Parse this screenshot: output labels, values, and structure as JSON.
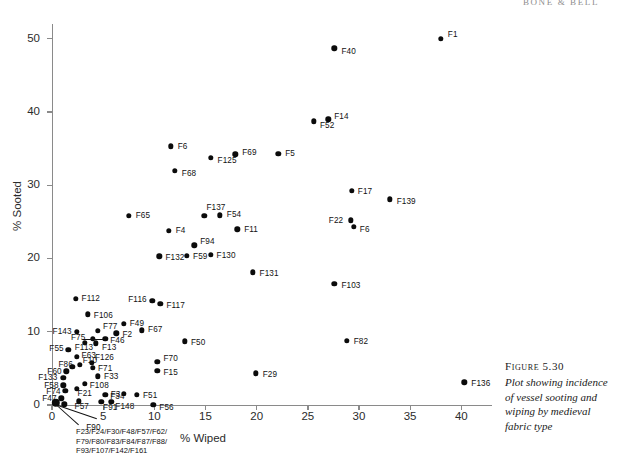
{
  "header": {
    "running_head": "BONE & BELL"
  },
  "caption": {
    "figure_number": "Figure 5.30",
    "text": "Plot showing incidence of vessel sooting and wiping by medieval fabric type"
  },
  "annotation": {
    "cluster_note_lines": [
      "F23/F24/F30/F48/F57/F62/",
      "F79/F80/F83/F84/F87/F88/",
      "F93/F107/F142/F161"
    ]
  },
  "chart_data": {
    "type": "scatter",
    "title": "Plot showing incidence of vessel sooting and wiping by medieval fabric type",
    "xlabel": "% Wiped",
    "ylabel": "% Sooted",
    "xlim": [
      0,
      43
    ],
    "ylim": [
      0,
      52
    ],
    "xticks": [
      0,
      5,
      10,
      15,
      20,
      25,
      30,
      35,
      40
    ],
    "yticks": [
      0,
      10,
      20,
      30,
      40,
      50
    ],
    "grid": false,
    "legend": null,
    "point_label_field": "fabric type",
    "points": [
      {
        "label": "F1",
        "x": 38.0,
        "y": 50.0,
        "lx": 7,
        "ly": -4
      },
      {
        "label": "F40",
        "x": 27.6,
        "y": 48.7,
        "lx": 7,
        "ly": 3
      },
      {
        "label": "F52",
        "x": 25.6,
        "y": 38.7,
        "lx": 6,
        "ly": 4
      },
      {
        "label": "F14",
        "x": 27.0,
        "y": 39.0,
        "lx": 6,
        "ly": -3
      },
      {
        "label": "F6",
        "x": 11.6,
        "y": 35.3,
        "lx": 7,
        "ly": 0
      },
      {
        "label": "F125",
        "x": 15.5,
        "y": 33.7,
        "lx": 7,
        "ly": 2
      },
      {
        "label": "F69",
        "x": 17.9,
        "y": 34.2,
        "lx": 7,
        "ly": -2
      },
      {
        "label": "F5",
        "x": 22.1,
        "y": 34.3,
        "lx": 7,
        "ly": 0
      },
      {
        "label": "F68",
        "x": 12.0,
        "y": 32.0,
        "lx": 7,
        "ly": 3
      },
      {
        "label": "F17",
        "x": 29.3,
        "y": 29.2,
        "lx": 6,
        "ly": 0
      },
      {
        "label": "F139",
        "x": 33.0,
        "y": 28.1,
        "lx": 7,
        "ly": 2
      },
      {
        "label": "F65",
        "x": 7.5,
        "y": 25.8,
        "lx": 7,
        "ly": 0
      },
      {
        "label": "F137",
        "x": 14.9,
        "y": 25.8,
        "lx": 2,
        "ly": -8
      },
      {
        "label": "F54",
        "x": 16.4,
        "y": 25.9,
        "lx": 7,
        "ly": -1
      },
      {
        "label": "F22",
        "x": 29.2,
        "y": 25.2,
        "lx": -22,
        "ly": 0
      },
      {
        "label": "F4",
        "x": 11.4,
        "y": 23.8,
        "lx": 7,
        "ly": 0
      },
      {
        "label": "F11",
        "x": 18.1,
        "y": 24.0,
        "lx": 7,
        "ly": 0
      },
      {
        "label": "F6b",
        "x": 29.5,
        "y": 24.3,
        "lx": 6,
        "ly": 3
      },
      {
        "label": "F94",
        "x": 13.9,
        "y": 21.8,
        "lx": 6,
        "ly": -4
      },
      {
        "label": "F132",
        "x": 10.5,
        "y": 20.3,
        "lx": 6,
        "ly": 1
      },
      {
        "label": "F59",
        "x": 13.2,
        "y": 20.4,
        "lx": 6,
        "ly": 1
      },
      {
        "label": "F130",
        "x": 15.5,
        "y": 20.5,
        "lx": 6,
        "ly": 1
      },
      {
        "label": "F131",
        "x": 19.6,
        "y": 18.1,
        "lx": 7,
        "ly": 1
      },
      {
        "label": "F103",
        "x": 27.6,
        "y": 16.5,
        "lx": 7,
        "ly": 1
      },
      {
        "label": "F116",
        "x": 9.8,
        "y": 14.2,
        "lx": -24,
        "ly": -1
      },
      {
        "label": "F117",
        "x": 10.6,
        "y": 13.8,
        "lx": 6,
        "ly": 2
      },
      {
        "label": "F112",
        "x": 2.3,
        "y": 14.5,
        "lx": 6,
        "ly": 0
      },
      {
        "label": "F106",
        "x": 3.5,
        "y": 12.4,
        "lx": 6,
        "ly": 1
      },
      {
        "label": "F49",
        "x": 7.0,
        "y": 11.1,
        "lx": 6,
        "ly": 0
      },
      {
        "label": "F143",
        "x": 2.4,
        "y": 10.0,
        "lx": -24,
        "ly": 0
      },
      {
        "label": "F77",
        "x": 4.5,
        "y": 10.1,
        "lx": 5,
        "ly": -4
      },
      {
        "label": "F2",
        "x": 6.3,
        "y": 9.8,
        "lx": 6,
        "ly": 1
      },
      {
        "label": "F67",
        "x": 8.8,
        "y": 10.2,
        "lx": 6,
        "ly": -1
      },
      {
        "label": "F46",
        "x": 5.2,
        "y": 9.0,
        "lx": 5,
        "ly": 1
      },
      {
        "label": "F75",
        "x": 4.0,
        "y": 9.0,
        "lx": -22,
        "ly": -2
      },
      {
        "label": "F13",
        "x": 4.3,
        "y": 8.4,
        "lx": 6,
        "ly": 4
      },
      {
        "label": "F113",
        "x": 3.2,
        "y": 8.5,
        "lx": -10,
        "ly": 5
      },
      {
        "label": "F50",
        "x": 13.0,
        "y": 8.7,
        "lx": 6,
        "ly": 1
      },
      {
        "label": "F55",
        "x": 1.6,
        "y": 7.5,
        "lx": -19,
        "ly": -2
      },
      {
        "label": "F63",
        "x": 2.4,
        "y": 6.6,
        "lx": 5,
        "ly": -1
      },
      {
        "label": "F126",
        "x": 3.9,
        "y": 5.8,
        "lx": 3,
        "ly": -5
      },
      {
        "label": "F10",
        "x": 2.7,
        "y": 5.5,
        "lx": 3,
        "ly": -4
      },
      {
        "label": "F86",
        "x": 2.0,
        "y": 5.2,
        "lx": -14,
        "ly": -2
      },
      {
        "label": "F71",
        "x": 4.0,
        "y": 5.1,
        "lx": 5,
        "ly": 1
      },
      {
        "label": "F70",
        "x": 10.3,
        "y": 5.9,
        "lx": 6,
        "ly": -3
      },
      {
        "label": "F15",
        "x": 10.3,
        "y": 4.7,
        "lx": 6,
        "ly": 2
      },
      {
        "label": "F60",
        "x": 1.4,
        "y": 4.6,
        "lx": -19,
        "ly": 0
      },
      {
        "label": "F33",
        "x": 4.5,
        "y": 3.9,
        "lx": 6,
        "ly": 0
      },
      {
        "label": "F133",
        "x": 1.1,
        "y": 3.7,
        "lx": -25,
        "ly": 0
      },
      {
        "label": "F108",
        "x": 3.2,
        "y": 2.9,
        "lx": 5,
        "ly": 2
      },
      {
        "label": "F58",
        "x": 1.1,
        "y": 2.7,
        "lx": -19,
        "ly": 0
      },
      {
        "label": "F21",
        "x": 2.4,
        "y": 2.2,
        "lx": 1,
        "ly": 5
      },
      {
        "label": "F74",
        "x": 1.3,
        "y": 1.9,
        "lx": -19,
        "ly": 0
      },
      {
        "label": "F34",
        "x": 5.2,
        "y": 1.4,
        "lx": 5,
        "ly": 2
      },
      {
        "label": "F3",
        "x": 7.0,
        "y": 1.5,
        "lx": -13,
        "ly": 0
      },
      {
        "label": "F51",
        "x": 8.3,
        "y": 1.4,
        "lx": 6,
        "ly": 1
      },
      {
        "label": "F47",
        "x": 0.9,
        "y": 0.9,
        "lx": -19,
        "ly": 0
      },
      {
        "label": "F57",
        "x": 2.6,
        "y": 0.5,
        "lx": -4,
        "ly": 5
      },
      {
        "label": "F91",
        "x": 4.8,
        "y": 0.4,
        "lx": 2,
        "ly": 5
      },
      {
        "label": "F148",
        "x": 5.8,
        "y": 0.4,
        "lx": 4,
        "ly": 4
      },
      {
        "label": "F56",
        "x": 9.9,
        "y": 0.0,
        "lx": 6,
        "ly": 2
      },
      {
        "label": "F136",
        "x": 40.3,
        "y": 3.1,
        "lx": 7,
        "ly": 1
      },
      {
        "label": "F82",
        "x": 28.8,
        "y": 8.8,
        "lx": 7,
        "ly": 1
      },
      {
        "label": "F29",
        "x": 19.9,
        "y": 4.3,
        "lx": 7,
        "ly": 1
      },
      {
        "label": "F90",
        "x": 1.2,
        "y": 0.1,
        "lx": 22,
        "ly": 23
      }
    ],
    "origin_cluster": {
      "x": 0.35,
      "y": 0.3,
      "note": "F23/F24/F30/F48/F57/F62/F79/F80/F83/F84/F87/F88/F93/F107/F142/F161"
    }
  }
}
